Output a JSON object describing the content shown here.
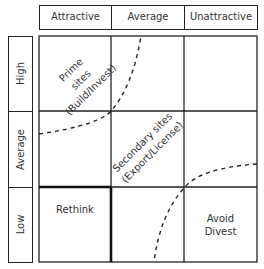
{
  "columns": {
    "labels": [
      "Attractive",
      "Average",
      "Unattractive"
    ]
  },
  "rows": {
    "labels": [
      "High",
      "Average",
      "Low"
    ]
  },
  "cells": {
    "prime": {
      "line1": "Prime",
      "line2": "sites",
      "line3": "(Build/Invest)"
    },
    "secondary": {
      "line1": "Secondary sites",
      "line2": "(Export/License)"
    },
    "rethink": "Rethink",
    "avoid": {
      "line1": "Avoid",
      "line2": "Divest"
    }
  },
  "colors": {
    "line": "#222222",
    "text": "#333333",
    "background": "#ffffff"
  }
}
